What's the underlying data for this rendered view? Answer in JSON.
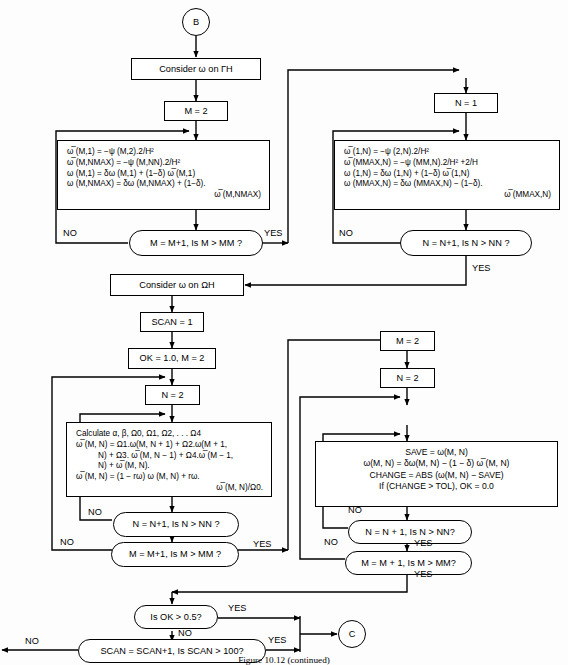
{
  "figure": {
    "caption": "Figure 10.12   (continued)"
  },
  "terminals": {
    "start": "B",
    "end": "C"
  },
  "labels": {
    "yes": "YES",
    "no": "NO"
  },
  "nodes": {
    "consider_gamma": "Consider ω on ΓH",
    "m_eq_2_top": "M = 2",
    "n_eq_1_top": "N = 1",
    "consider_omega": "Consider ω on ΩH",
    "scan_eq_1": "SCAN = 1",
    "ok_m_init": "OK = 1.0, M = 2",
    "n_eq_2_left": "N = 2",
    "m_eq_2_right": "M = 2",
    "n_eq_2_right": "N = 2"
  },
  "decisions": {
    "m_loop_top": "M = M+1,  Is M > MM ?",
    "n_loop_top": "N = N+1,  Is N > NN ?",
    "n_loop_left": "N = N+1,  Is N > NN ?",
    "m_loop_left": "M = M+1,  Is M > MM ?",
    "n_loop_right": "N = N + 1, Is N > NN?",
    "m_loop_right": "M = M + 1, Is M > MM?",
    "ok_check": "Is OK > 0.5?",
    "scan_check": "SCAN = SCAN+1, Is SCAN > 100?"
  },
  "formula_left_top": {
    "lines": [
      "ω̅ (M,1) = −ψ (M,2).2/H²",
      "ω̅ (M,NMAX) = −ψ (M,NN).2/H²",
      "ω (M,1) = δω (M,1) + (1−δ) ω̅ (M,1)",
      "ω (M,NMAX) = δω (M,NMAX) + (1−δ).",
      "ω̅ (M,NMAX)"
    ]
  },
  "formula_right_top": {
    "lines": [
      "ω̅ (1,N) = −ψ (2,N).2/H²",
      "ω̅ (MMAX,N) = −ψ (MM,N).2/H² +2/H",
      "ω (1,N) = δω (1,N) + (1−δ) ω̅ (1,N)",
      "ω (MMAX,N) = δω (MMAX,N) − (1−δ).",
      "ω̅ (MMAX,N)"
    ]
  },
  "formula_calculate": {
    "lines": [
      "Calculate α, β, Ω0, Ω1, Ω2, . . . Ω4",
      "ω̅ (M, N) = Ω1.ω(M, N + 1) + Ω2.ω(M + 1,",
      "N) + Ω3. ω̅ (M, N − 1) + Ω4.ω̅ (M − 1,",
      "N) + ω̅ (M, N).",
      "ω̅ (M, N) = (1 − rω) ω (M, N) + rω.",
      "ω̅ (M, N)/Ω0."
    ]
  },
  "formula_save": {
    "lines": [
      "SAVE = ω(M, N)",
      "ω(M, N) = δω(M, N) − (1 − δ) ω̅ (M, N)",
      "CHANGE = ABS (ω(M, N) − SAVE)",
      "If (CHANGE > TOL), OK = 0.0"
    ]
  },
  "colors": {
    "line": "#000000",
    "background": "#ffffff"
  }
}
